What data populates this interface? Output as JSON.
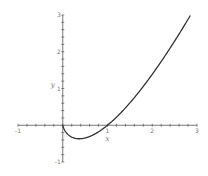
{
  "chart_data": {
    "type": "line",
    "title": "",
    "xlabel": "x",
    "ylabel": "y",
    "xlim": [
      -1,
      3
    ],
    "ylim": [
      -1,
      3
    ],
    "x_ticks_labeled": [
      -1,
      1,
      2,
      3
    ],
    "x_tick_labels": [
      "-1",
      "1",
      "2",
      "3"
    ],
    "y_ticks_labeled": [
      -1,
      1,
      2,
      3
    ],
    "y_tick_labels": [
      "-1",
      "1",
      "2",
      "3"
    ],
    "minor_tick_step": 0.2,
    "grid": false,
    "legend": "none",
    "series": [
      {
        "name": "x ln(x)",
        "expression": "x*ln(x)",
        "color": "#333333",
        "x": [
          0,
          0.05,
          0.1,
          0.2,
          0.3,
          0.368,
          0.5,
          0.7,
          1.0,
          1.3,
          1.6,
          2.0,
          2.3,
          2.6,
          2.86
        ],
        "y": [
          0,
          -0.15,
          -0.23,
          -0.322,
          -0.361,
          -0.368,
          -0.347,
          -0.25,
          0,
          0.341,
          0.752,
          1.386,
          1.916,
          2.484,
          3.0
        ]
      }
    ]
  }
}
